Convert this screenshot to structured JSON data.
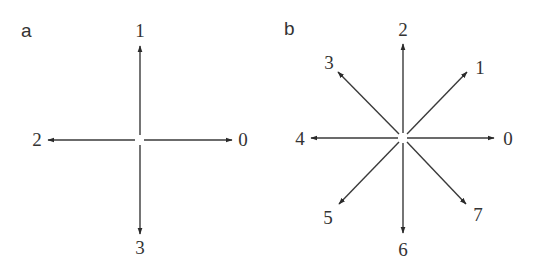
{
  "diagram": {
    "colors": {
      "line": "#3a3a3a",
      "text": "#333333",
      "background": "#ffffff"
    },
    "panels": [
      {
        "label": "a",
        "description": "4-connectivity chain code directions",
        "directions": [
          {
            "code": "0",
            "angle_deg": 0
          },
          {
            "code": "1",
            "angle_deg": 90
          },
          {
            "code": "2",
            "angle_deg": 180
          },
          {
            "code": "3",
            "angle_deg": 270
          }
        ]
      },
      {
        "label": "b",
        "description": "8-connectivity chain code directions",
        "directions": [
          {
            "code": "0",
            "angle_deg": 0
          },
          {
            "code": "1",
            "angle_deg": 45
          },
          {
            "code": "2",
            "angle_deg": 90
          },
          {
            "code": "3",
            "angle_deg": 135
          },
          {
            "code": "4",
            "angle_deg": 180
          },
          {
            "code": "5",
            "angle_deg": 225
          },
          {
            "code": "6",
            "angle_deg": 270
          },
          {
            "code": "7",
            "angle_deg": 315
          }
        ]
      }
    ]
  }
}
